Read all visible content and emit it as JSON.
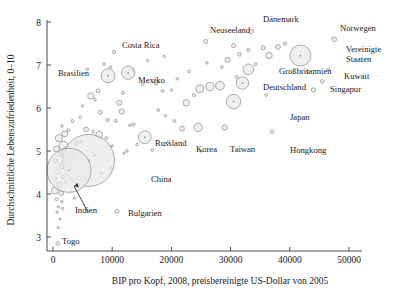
{
  "chart_data": {
    "type": "scatter",
    "title": "",
    "xlabel": "BIP pro Kopf, 2008, preisbereinigte US-Dollar von 2005",
    "ylabel": "Durchschnittliche Lebenszufriedenheit, 0–10",
    "xlim": [
      -1200,
      53000
    ],
    "ylim": [
      2.75,
      8.15
    ],
    "xticks": [
      0,
      10000,
      20000,
      30000,
      40000,
      50000
    ],
    "xticklabels": [
      "0",
      "10000",
      "20000",
      "30000",
      "40000",
      "50000"
    ],
    "yticks": [
      3,
      4,
      5,
      6,
      7,
      8
    ],
    "yticklabels": [
      "3",
      "4",
      "5",
      "6",
      "7",
      "8"
    ],
    "grid": false,
    "legend": null,
    "size_encoding": "Bevölkerung (Blasengröße)",
    "labeled_points": [
      {
        "name": "Costa Rica",
        "x": 10300,
        "y": 7.3,
        "r": 1.6,
        "lx": 122,
        "ly": 48,
        "anchor": "start"
      },
      {
        "name": "Neuseeland",
        "x": 25800,
        "y": 7.55,
        "r": 2.0,
        "lx": 210,
        "ly": 33,
        "anchor": "start"
      },
      {
        "name": "Dänemark",
        "x": 33500,
        "y": 7.78,
        "r": 2.2,
        "lx": 263,
        "ly": 22,
        "anchor": "start"
      },
      {
        "name": "Norwegen",
        "x": 47500,
        "y": 7.6,
        "r": 2.4,
        "lx": 340,
        "ly": 31,
        "anchor": "start"
      },
      {
        "name": "Brasilien",
        "x": 9300,
        "y": 6.75,
        "r": 7.0,
        "lx": 58,
        "ly": 76,
        "anchor": "start"
      },
      {
        "name": "Mexiko",
        "x": 12700,
        "y": 6.82,
        "r": 6.6,
        "lx": 138,
        "ly": 83,
        "anchor": "start"
      },
      {
        "name": "Vereinigte Staaten",
        "x": 41800,
        "y": 7.22,
        "r": 10.5,
        "lx": 346,
        "ly": 52,
        "anchor": "start"
      },
      {
        "name": "Großbritannien",
        "x": 33000,
        "y": 6.9,
        "r": 5.3,
        "lx": 279,
        "ly": 74,
        "anchor": "start"
      },
      {
        "name": "Deutschland",
        "x": 32000,
        "y": 6.58,
        "r": 6.2,
        "lx": 263,
        "ly": 90,
        "anchor": "start"
      },
      {
        "name": "Kuwait",
        "x": 45500,
        "y": 6.62,
        "r": 1.8,
        "lx": 344,
        "ly": 79,
        "anchor": "start"
      },
      {
        "name": "Singapur",
        "x": 44000,
        "y": 6.42,
        "r": 2.2,
        "lx": 330,
        "ly": 92,
        "anchor": "start"
      },
      {
        "name": "Japan",
        "x": 30500,
        "y": 6.15,
        "r": 7.2,
        "lx": 290,
        "ly": 120,
        "anchor": "start"
      },
      {
        "name": "Korea",
        "x": 24500,
        "y": 5.55,
        "r": 4.2,
        "lx": 196,
        "ly": 152,
        "anchor": "start"
      },
      {
        "name": "Taiwan",
        "x": 29000,
        "y": 5.55,
        "r": 2.6,
        "lx": 230,
        "ly": 152,
        "anchor": "start"
      },
      {
        "name": "Hongkong",
        "x": 37000,
        "y": 5.45,
        "r": 1.7,
        "lx": 290,
        "ly": 153,
        "anchor": "start"
      },
      {
        "name": "Russland",
        "x": 15500,
        "y": 5.32,
        "r": 6.4,
        "lx": 155,
        "ly": 146,
        "anchor": "start"
      },
      {
        "name": "China",
        "x": 6000,
        "y": 4.78,
        "r": 26.0,
        "lx": 151,
        "ly": 182,
        "anchor": "start"
      },
      {
        "name": "Indien",
        "x": 2700,
        "y": 4.55,
        "r": 22.0,
        "lx": 75,
        "ly": 213,
        "anchor": "start"
      },
      {
        "name": "Bulgarien",
        "x": 10800,
        "y": 3.6,
        "r": 2.0,
        "lx": 128,
        "ly": 216,
        "anchor": "start"
      },
      {
        "name": "Togo",
        "x": 800,
        "y": 2.85,
        "r": 1.8,
        "lx": 62,
        "ly": 244,
        "anchor": "start"
      }
    ],
    "unlabeled_points": [
      {
        "x": 8600,
        "y": 7.02,
        "r": 1.4
      },
      {
        "x": 9700,
        "y": 6.95,
        "r": 1.3
      },
      {
        "x": 7600,
        "y": 6.4,
        "r": 2.0
      },
      {
        "x": 7100,
        "y": 6.2,
        "r": 1.3
      },
      {
        "x": 6400,
        "y": 6.28,
        "r": 3.2
      },
      {
        "x": 11200,
        "y": 6.12,
        "r": 2.6
      },
      {
        "x": 11800,
        "y": 6.35,
        "r": 1.6
      },
      {
        "x": 15100,
        "y": 6.55,
        "r": 1.5
      },
      {
        "x": 17400,
        "y": 6.6,
        "r": 2.6
      },
      {
        "x": 18500,
        "y": 6.4,
        "r": 1.4
      },
      {
        "x": 5000,
        "y": 6.05,
        "r": 1.2
      },
      {
        "x": 4600,
        "y": 5.78,
        "r": 1.4
      },
      {
        "x": 8000,
        "y": 5.9,
        "r": 2.0
      },
      {
        "x": 9200,
        "y": 5.72,
        "r": 1.6
      },
      {
        "x": 10600,
        "y": 5.7,
        "r": 1.5
      },
      {
        "x": 11600,
        "y": 5.92,
        "r": 2.6
      },
      {
        "x": 13600,
        "y": 5.62,
        "r": 1.5
      },
      {
        "x": 3300,
        "y": 5.7,
        "r": 1.5
      },
      {
        "x": 2600,
        "y": 5.48,
        "r": 1.6
      },
      {
        "x": 2000,
        "y": 5.4,
        "r": 3.0
      },
      {
        "x": 1500,
        "y": 5.58,
        "r": 1.4
      },
      {
        "x": 5600,
        "y": 5.5,
        "r": 2.4
      },
      {
        "x": 6800,
        "y": 5.45,
        "r": 1.4
      },
      {
        "x": 7800,
        "y": 5.38,
        "r": 3.4
      },
      {
        "x": 9000,
        "y": 5.3,
        "r": 1.4
      },
      {
        "x": 4000,
        "y": 5.18,
        "r": 2.0
      },
      {
        "x": 4700,
        "y": 5.22,
        "r": 1.6
      },
      {
        "x": 1000,
        "y": 5.3,
        "r": 3.6
      },
      {
        "x": 1800,
        "y": 5.12,
        "r": 4.6
      },
      {
        "x": 600,
        "y": 5.05,
        "r": 3.0
      },
      {
        "x": 2400,
        "y": 4.95,
        "r": 6.4
      },
      {
        "x": 1200,
        "y": 4.92,
        "r": 2.2
      },
      {
        "x": 3100,
        "y": 4.8,
        "r": 2.8
      },
      {
        "x": 400,
        "y": 4.78,
        "r": 2.0
      },
      {
        "x": 1600,
        "y": 4.66,
        "r": 3.2
      },
      {
        "x": 2900,
        "y": 4.62,
        "r": 1.4
      },
      {
        "x": 800,
        "y": 4.52,
        "r": 2.4
      },
      {
        "x": 1700,
        "y": 4.4,
        "r": 2.0
      },
      {
        "x": 400,
        "y": 4.35,
        "r": 1.6
      },
      {
        "x": 1100,
        "y": 4.22,
        "r": 2.8
      },
      {
        "x": 2100,
        "y": 4.28,
        "r": 1.5
      },
      {
        "x": 300,
        "y": 4.08,
        "r": 3.4
      },
      {
        "x": 1400,
        "y": 4.02,
        "r": 2.4
      },
      {
        "x": 600,
        "y": 3.88,
        "r": 1.5
      },
      {
        "x": 1500,
        "y": 3.82,
        "r": 1.3
      },
      {
        "x": 900,
        "y": 3.7,
        "r": 1.2
      },
      {
        "x": 1600,
        "y": 3.66,
        "r": 1.2
      },
      {
        "x": 700,
        "y": 3.58,
        "r": 1.2
      },
      {
        "x": 1200,
        "y": 3.42,
        "r": 1.1
      },
      {
        "x": 900,
        "y": 3.22,
        "r": 1.1
      },
      {
        "x": 3600,
        "y": 3.9,
        "r": 1.2
      },
      {
        "x": 4200,
        "y": 4.18,
        "r": 1.2
      },
      {
        "x": 5400,
        "y": 4.35,
        "r": 1.3
      },
      {
        "x": 8200,
        "y": 4.48,
        "r": 1.3
      },
      {
        "x": 9800,
        "y": 4.6,
        "r": 1.3
      },
      {
        "x": 7000,
        "y": 4.9,
        "r": 1.2
      },
      {
        "x": 12500,
        "y": 5.0,
        "r": 1.3
      },
      {
        "x": 14200,
        "y": 5.15,
        "r": 1.3
      },
      {
        "x": 16800,
        "y": 5.02,
        "r": 1.3
      },
      {
        "x": 19500,
        "y": 5.22,
        "r": 1.3
      },
      {
        "x": 13000,
        "y": 5.6,
        "r": 1.3
      },
      {
        "x": 20500,
        "y": 5.7,
        "r": 1.4
      },
      {
        "x": 21800,
        "y": 5.52,
        "r": 2.4
      },
      {
        "x": 19000,
        "y": 5.82,
        "r": 1.3
      },
      {
        "x": 17800,
        "y": 5.95,
        "r": 1.3
      },
      {
        "x": 22500,
        "y": 6.12,
        "r": 3.2
      },
      {
        "x": 23800,
        "y": 6.3,
        "r": 1.5
      },
      {
        "x": 24800,
        "y": 6.45,
        "r": 4.0
      },
      {
        "x": 26500,
        "y": 6.5,
        "r": 4.2
      },
      {
        "x": 28200,
        "y": 6.52,
        "r": 4.4
      },
      {
        "x": 20000,
        "y": 6.42,
        "r": 1.3
      },
      {
        "x": 21000,
        "y": 6.68,
        "r": 1.3
      },
      {
        "x": 23000,
        "y": 6.85,
        "r": 1.4
      },
      {
        "x": 26000,
        "y": 7.05,
        "r": 1.3
      },
      {
        "x": 29500,
        "y": 7.12,
        "r": 2.6
      },
      {
        "x": 31500,
        "y": 7.25,
        "r": 1.8
      },
      {
        "x": 30500,
        "y": 7.45,
        "r": 2.0
      },
      {
        "x": 33000,
        "y": 7.35,
        "r": 1.6
      },
      {
        "x": 35500,
        "y": 7.4,
        "r": 2.0
      },
      {
        "x": 38000,
        "y": 7.42,
        "r": 2.4
      },
      {
        "x": 39200,
        "y": 7.5,
        "r": 1.6
      },
      {
        "x": 36500,
        "y": 7.22,
        "r": 3.2
      },
      {
        "x": 34200,
        "y": 7.02,
        "r": 1.5
      },
      {
        "x": 28500,
        "y": 6.95,
        "r": 1.4
      },
      {
        "x": 31000,
        "y": 6.72,
        "r": 1.5
      },
      {
        "x": 36000,
        "y": 6.3,
        "r": 1.3
      },
      {
        "x": 43000,
        "y": 6.85,
        "r": 1.4
      },
      {
        "x": 46500,
        "y": 6.9,
        "r": 1.3
      },
      {
        "x": 25000,
        "y": 5.0,
        "r": 1.2
      },
      {
        "x": 12000,
        "y": 4.95,
        "r": 1.2
      },
      {
        "x": 10000,
        "y": 5.12,
        "r": 1.2
      },
      {
        "x": 5800,
        "y": 6.9,
        "r": 1.3
      },
      {
        "x": 13500,
        "y": 6.88,
        "r": 1.2
      },
      {
        "x": 16000,
        "y": 7.1,
        "r": 1.2
      },
      {
        "x": 18800,
        "y": 7.2,
        "r": 1.2
      }
    ],
    "annotation": {
      "label": "Indien",
      "arrow_from": [
        88,
        212
      ],
      "arrow_to": [
        74,
        186
      ]
    }
  }
}
